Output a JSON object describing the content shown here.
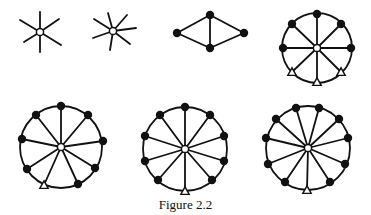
{
  "caption": "Figure 2.2",
  "colors": {
    "stroke": "#111111",
    "fill_solid": "#111111",
    "fill_open": "#ffffff"
  },
  "figures": [
    {
      "id": "star-6",
      "type": "star",
      "center": [
        40,
        32
      ],
      "center_node": "open-circle",
      "leaves": [
        [
          40,
          12
        ],
        [
          59,
          19
        ],
        [
          61,
          45
        ],
        [
          40,
          52
        ],
        [
          24,
          42
        ],
        [
          20,
          20
        ]
      ]
    },
    {
      "id": "star-7",
      "type": "star",
      "center": [
        113,
        31
      ],
      "center_node": "open-circle",
      "leaves": [
        [
          108,
          13
        ],
        [
          127,
          15
        ],
        [
          136,
          28
        ],
        [
          130,
          44
        ],
        [
          110,
          50
        ],
        [
          93,
          38
        ],
        [
          94,
          19
        ]
      ]
    },
    {
      "id": "diamond",
      "type": "graph",
      "nodes": [
        [
          177,
          33
        ],
        [
          210,
          15
        ],
        [
          244,
          33
        ],
        [
          210,
          48
        ]
      ],
      "edges": [
        [
          0,
          1
        ],
        [
          1,
          2
        ],
        [
          2,
          3
        ],
        [
          3,
          0
        ],
        [
          1,
          3
        ]
      ]
    },
    {
      "id": "wheel-8",
      "type": "wheel",
      "center": [
        317,
        48
      ],
      "radius": 35,
      "rim_nodes": [
        {
          "pos": [
            317,
            14
          ],
          "kind": "solid"
        },
        {
          "pos": [
            341,
            24
          ],
          "kind": "solid"
        },
        {
          "pos": [
            351,
            48
          ],
          "kind": "solid"
        },
        {
          "pos": [
            341,
            72
          ],
          "kind": "triangle"
        },
        {
          "pos": [
            317,
            82
          ],
          "kind": "triangle"
        },
        {
          "pos": [
            292,
            72
          ],
          "kind": "triangle"
        },
        {
          "pos": [
            283,
            48
          ],
          "kind": "solid"
        },
        {
          "pos": [
            292,
            24
          ],
          "kind": "solid"
        }
      ]
    },
    {
      "id": "wheel-9",
      "type": "wheel",
      "center": [
        61,
        147
      ],
      "radius": 41,
      "rim_nodes": [
        {
          "pos": [
            61,
            106
          ],
          "kind": "solid"
        },
        {
          "pos": [
            88,
            115
          ],
          "kind": "solid"
        },
        {
          "pos": [
            103,
            141
          ],
          "kind": "solid"
        },
        {
          "pos": [
            95,
            168
          ],
          "kind": "solid"
        },
        {
          "pos": [
            78,
            184
          ],
          "kind": "solid"
        },
        {
          "pos": [
            44,
            185
          ],
          "kind": "triangle"
        },
        {
          "pos": [
            27,
            169
          ],
          "kind": "solid"
        },
        {
          "pos": [
            22,
            139
          ],
          "kind": "solid"
        },
        {
          "pos": [
            36,
            115
          ],
          "kind": "solid"
        }
      ]
    },
    {
      "id": "wheel-10",
      "type": "wheel",
      "center": [
        185,
        149
      ],
      "radius": 42,
      "rim_nodes": [
        {
          "pos": [
            185,
            107
          ],
          "kind": "solid"
        },
        {
          "pos": [
            210,
            115
          ],
          "kind": "solid"
        },
        {
          "pos": [
            224,
            136
          ],
          "kind": "solid"
        },
        {
          "pos": [
            224,
            161
          ],
          "kind": "solid"
        },
        {
          "pos": [
            212,
            180
          ],
          "kind": "solid"
        },
        {
          "pos": [
            185,
            191
          ],
          "kind": "triangle"
        },
        {
          "pos": [
            158,
            180
          ],
          "kind": "solid"
        },
        {
          "pos": [
            145,
            161
          ],
          "kind": "solid"
        },
        {
          "pos": [
            145,
            136
          ],
          "kind": "solid"
        },
        {
          "pos": [
            160,
            115
          ],
          "kind": "solid"
        }
      ]
    },
    {
      "id": "wheel-11",
      "type": "wheel",
      "center": [
        308,
        148
      ],
      "radius": 42,
      "rim_nodes": [
        {
          "pos": [
            296,
            108
          ],
          "kind": "solid"
        },
        {
          "pos": [
            319,
            108
          ],
          "kind": "solid"
        },
        {
          "pos": [
            339,
            119
          ],
          "kind": "solid"
        },
        {
          "pos": [
            348,
            138
          ],
          "kind": "solid"
        },
        {
          "pos": [
            345,
            164
          ],
          "kind": "solid"
        },
        {
          "pos": [
            330,
            182
          ],
          "kind": "solid"
        },
        {
          "pos": [
            307,
            190
          ],
          "kind": "triangle"
        },
        {
          "pos": [
            285,
            182
          ],
          "kind": "solid"
        },
        {
          "pos": [
            268,
            164
          ],
          "kind": "solid"
        },
        {
          "pos": [
            266,
            138
          ],
          "kind": "solid"
        },
        {
          "pos": [
            276,
            119
          ],
          "kind": "solid"
        }
      ]
    }
  ]
}
